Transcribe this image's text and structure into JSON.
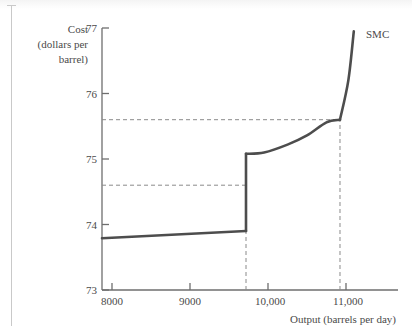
{
  "figure": {
    "series_label": "SMC",
    "y_axis_title_lines": [
      "Cost",
      "(dollars per",
      "barrel)"
    ],
    "x_axis_title": "Output (barrels per day)"
  },
  "chart_data": {
    "type": "line",
    "title": "",
    "xlabel": "Output (barrels per day)",
    "ylabel": "Cost (dollars per barrel)",
    "xlim": [
      7870,
      11100
    ],
    "ylim": [
      73,
      77
    ],
    "grid": false,
    "legend": "inline-right",
    "xticks": [
      8000,
      9000,
      10000,
      11000
    ],
    "xticklabels": [
      "8000",
      "9000",
      "10,000",
      "11,000"
    ],
    "yticks": [
      73,
      74,
      75,
      76,
      77
    ],
    "yticklabels": [
      "73",
      "74",
      "75",
      "76",
      "77"
    ],
    "series": [
      {
        "name": "SMC",
        "note": "short-run marginal cost with discontinuous jump at capacity switch",
        "segment_1": {
          "description": "gently rising lower branch before the jump",
          "points": [
            [
              7872,
              73.79
            ],
            [
              9718,
              73.9
            ]
          ]
        },
        "jump": {
          "description": "vertical discontinuity at output where plant switches",
          "x": 9718,
          "y_from": 73.9,
          "y_to": 75.08
        },
        "segment_2": {
          "description": "upper branch rising with increasing slope",
          "points": [
            [
              9718,
              75.08
            ],
            [
              9950,
              75.1
            ],
            [
              10250,
              75.22
            ],
            [
              10500,
              75.36
            ],
            [
              10750,
              75.56
            ],
            [
              10923,
              75.6
            ]
          ]
        },
        "segment_3": {
          "description": "steep near-vertical final rise",
          "points": [
            [
              10923,
              75.6
            ],
            [
              11030,
              76.2
            ],
            [
              11100,
              76.95
            ]
          ]
        }
      }
    ],
    "annotations": [
      {
        "type": "hline",
        "y": 75.6,
        "style": "dashed",
        "x_from": 7872,
        "x_to": 10923,
        "label": ""
      },
      {
        "type": "hline",
        "y": 74.6,
        "style": "dashed",
        "x_from": 7872,
        "x_to": 9718,
        "label": ""
      },
      {
        "type": "vline",
        "x": 9718,
        "style": "dashed",
        "y_from": 73.0,
        "y_to": 74.6,
        "label": ""
      },
      {
        "type": "vline",
        "x": 10923,
        "style": "dashed",
        "y_from": 73.0,
        "y_to": 75.6,
        "label": ""
      }
    ]
  }
}
